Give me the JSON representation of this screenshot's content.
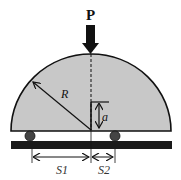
{
  "diagram": {
    "load_label": "P",
    "radius_label": "R",
    "height_label": "a",
    "span1_label": "S1",
    "span2_label": "S2",
    "colors": {
      "body_fill": "#c8c8c8",
      "stroke": "#111111",
      "base_bar": "#1a1a1a",
      "roller": "#444444",
      "background": "#ffffff"
    }
  }
}
